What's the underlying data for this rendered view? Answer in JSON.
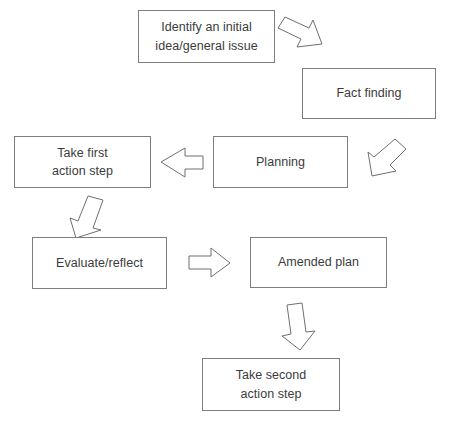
{
  "diagram": {
    "background_color": "#ffffff",
    "box_border_color": "#7d7d7d",
    "text_color": "#3b3b3b",
    "arrow_stroke_color": "#6f6f6f",
    "nodes": [
      {
        "id": "identify",
        "label": "Identify an initial\nidea/general issue",
        "x": 138,
        "y": 10,
        "w": 137,
        "h": 53
      },
      {
        "id": "fact-finding",
        "label": "Fact finding",
        "x": 302,
        "y": 68,
        "w": 134,
        "h": 51
      },
      {
        "id": "planning",
        "label": "Planning",
        "x": 213,
        "y": 136,
        "w": 135,
        "h": 52
      },
      {
        "id": "take-first-action-step",
        "label": "Take first\naction step",
        "x": 14,
        "y": 136,
        "w": 137,
        "h": 52
      },
      {
        "id": "evaluate-reflect",
        "label": "Evaluate/reflect",
        "x": 32,
        "y": 237,
        "w": 135,
        "h": 52
      },
      {
        "id": "amended-plan",
        "label": "Amended plan",
        "x": 250,
        "y": 237,
        "w": 137,
        "h": 51
      },
      {
        "id": "take-second-action-step",
        "label": "Take second\naction step",
        "x": 202,
        "y": 358,
        "w": 138,
        "h": 53
      }
    ],
    "connectors": [
      {
        "id": "identify-to-fact-finding",
        "from": "identify",
        "to": "fact-finding",
        "direction": "down-right"
      },
      {
        "id": "fact-finding-to-planning",
        "from": "fact-finding",
        "to": "planning",
        "direction": "down-left"
      },
      {
        "id": "planning-to-take-first-action-step",
        "from": "planning",
        "to": "take-first-action-step",
        "direction": "left"
      },
      {
        "id": "take-first-action-step-to-evaluate-reflect",
        "from": "take-first-action-step",
        "to": "evaluate-reflect",
        "direction": "down-left"
      },
      {
        "id": "evaluate-reflect-to-amended-plan",
        "from": "evaluate-reflect",
        "to": "amended-plan",
        "direction": "right"
      },
      {
        "id": "amended-plan-to-take-second-action-step",
        "from": "amended-plan",
        "to": "take-second-action-step",
        "direction": "down"
      }
    ]
  }
}
